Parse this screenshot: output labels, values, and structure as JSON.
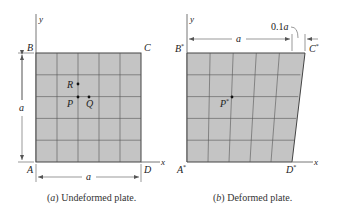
{
  "figure": {
    "panel_a": {
      "caption_prefix": "(a)",
      "caption_text": " Undeformed plate.",
      "corner_labels": {
        "A": "A",
        "B": "B",
        "C": "C",
        "D": "D"
      },
      "axis_labels": {
        "x": "x",
        "y": "y"
      },
      "dimension_labels": {
        "height": "a",
        "width": "a"
      },
      "point_labels": {
        "P": "P",
        "Q": "Q",
        "R": "R"
      },
      "grid_divisions": 5
    },
    "panel_b": {
      "caption_prefix": "(b)",
      "caption_text": " Deformed plate.",
      "corner_labels": {
        "A": "A*",
        "B": "B*",
        "C": "C*",
        "D": "D*"
      },
      "axis_labels": {
        "x": "x",
        "y": "y"
      },
      "dimension_labels": {
        "width": "a",
        "shift": "0.1a"
      },
      "point_labels": {
        "P": "P*"
      },
      "grid_divisions": 5,
      "top_edge_shift_fraction": 0.1
    }
  },
  "colors": {
    "plate_fill": "#c4c4c4",
    "line": "#444444",
    "axis": "#777777"
  }
}
